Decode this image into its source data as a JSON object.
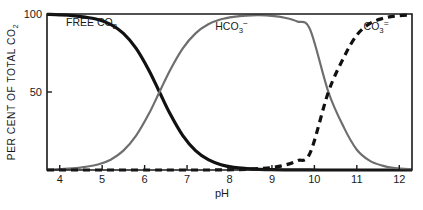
{
  "chart_data": {
    "type": "line",
    "title": "",
    "xlabel": "pH",
    "ylabel": "PER CENT OF TOTAL CO2",
    "ylabel_parts": {
      "main": "PER CENT OF TOTAL CO",
      "sub": "2"
    },
    "xlim": [
      3.7,
      12.3
    ],
    "ylim": [
      0,
      100
    ],
    "xticks": [
      "4",
      "5",
      "6",
      "7",
      "8",
      "9",
      "10",
      "11",
      "12"
    ],
    "xtick_values": [
      4,
      5,
      6,
      7,
      8,
      9,
      10,
      11,
      12
    ],
    "yticks": [
      "50",
      "100"
    ],
    "ytick_values": [
      50,
      100
    ],
    "grid": false,
    "legend_position": "inline-annotations",
    "x": [
      3.7,
      4.0,
      4.3,
      4.6,
      4.9,
      5.2,
      5.5,
      5.8,
      6.1,
      6.35,
      6.6,
      6.9,
      7.2,
      7.5,
      7.8,
      8.1,
      8.4,
      8.7,
      9.0,
      9.3,
      9.6,
      9.9,
      10.33,
      10.7,
      11.0,
      11.3,
      11.6,
      11.9,
      12.3
    ],
    "series": [
      {
        "name": "FREE CO2",
        "label_main": "FREE CO",
        "label_sub": "2",
        "label_sup": "",
        "color": "#111111",
        "style": "solid",
        "width": 3.2,
        "label_x": 4.15,
        "label_y": 92,
        "values": [
          99.8,
          99.5,
          99.0,
          98.0,
          96.5,
          93.4,
          87.6,
          78.0,
          64.0,
          50.0,
          36.0,
          22.0,
          12.4,
          6.6,
          3.4,
          1.7,
          0.9,
          0.45,
          0.2,
          0.1,
          0.05,
          0.02,
          0.0,
          0.0,
          0.0,
          0.0,
          0.0,
          0.0,
          0.0
        ]
      },
      {
        "name": "HCO3-",
        "label_main": "HCO",
        "label_sub": "3",
        "label_sup": "−",
        "color": "#6e6e6e",
        "style": "solid",
        "width": 2.2,
        "label_x": 8.05,
        "label_y": 90,
        "values": [
          0.2,
          0.5,
          1.0,
          2.0,
          3.5,
          6.6,
          12.4,
          22.0,
          36.0,
          50.0,
          64.0,
          78.0,
          87.6,
          93.4,
          96.6,
          98.2,
          99.0,
          99.2,
          98.8,
          97.6,
          95.2,
          90.0,
          50.0,
          27.0,
          13.0,
          6.0,
          2.8,
          1.2,
          0.4
        ]
      },
      {
        "name": "CO3=",
        "label_main": "CO",
        "label_sub": "3",
        "label_sup": "=",
        "color": "#111111",
        "style": "dashed",
        "width": 3.2,
        "label_x": 11.75,
        "label_y": 90,
        "values": [
          0,
          0,
          0,
          0,
          0,
          0,
          0,
          0,
          0,
          0,
          0,
          0,
          0,
          0,
          0.1,
          0.2,
          0.4,
          0.9,
          1.6,
          3.1,
          6.0,
          11.0,
          50.0,
          72.5,
          86.5,
          93.8,
          97.1,
          98.7,
          99.5
        ]
      }
    ],
    "annotations": [
      {
        "text": "FREE CO2",
        "at_ph": 4.15,
        "at_pct": 92
      },
      {
        "text": "HCO3-",
        "at_ph": 8.05,
        "at_pct": 90
      },
      {
        "text": "CO3=",
        "at_ph": 11.75,
        "at_pct": 90
      }
    ],
    "crossings": [
      {
        "species": [
          "FREE CO2",
          "HCO3-"
        ],
        "ph": 6.35,
        "percent": 50
      },
      {
        "species": [
          "HCO3-",
          "CO3="
        ],
        "ph": 10.33,
        "percent": 50
      }
    ]
  }
}
